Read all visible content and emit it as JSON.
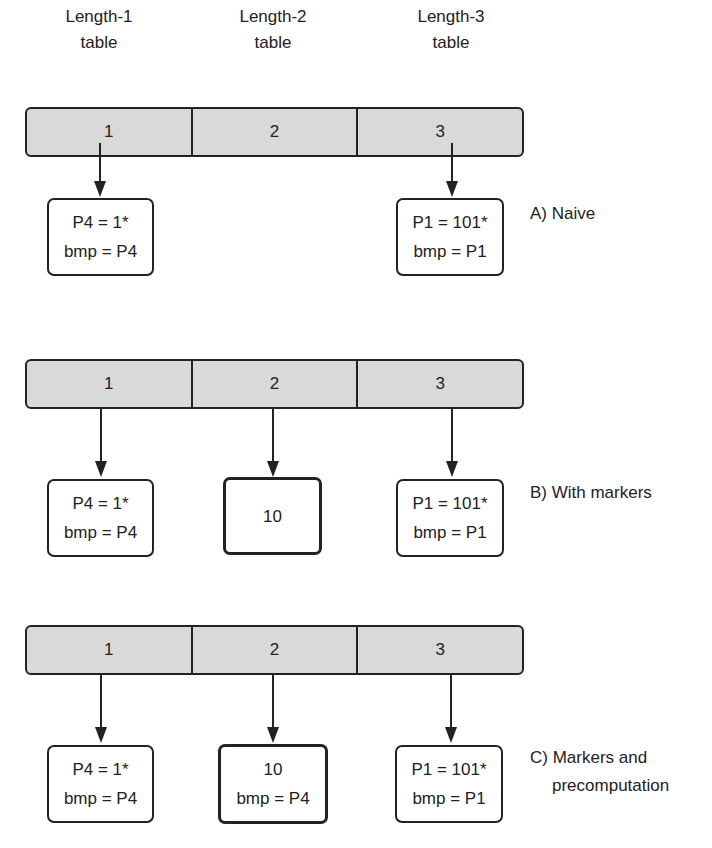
{
  "diagram": {
    "headers": [
      {
        "line1": "Length-1",
        "line2": "table"
      },
      {
        "line1": "Length-2",
        "line2": "table"
      },
      {
        "line1": "Length-3",
        "line2": "table"
      }
    ],
    "sections": [
      {
        "id": "A",
        "label": "A) Naive",
        "bar_cells": [
          "1",
          "2",
          "3"
        ],
        "entries": [
          {
            "column": 1,
            "type": "prefix",
            "line1": "P4 = 1*",
            "line2": "bmp = P4"
          },
          {
            "column": 3,
            "type": "prefix",
            "line1": "P1 = 101*",
            "line2": "bmp = P1"
          }
        ]
      },
      {
        "id": "B",
        "label": "B) With markers",
        "bar_cells": [
          "1",
          "2",
          "3"
        ],
        "entries": [
          {
            "column": 1,
            "type": "prefix",
            "line1": "P4 = 1*",
            "line2": "bmp = P4"
          },
          {
            "column": 2,
            "type": "marker",
            "line1": "10",
            "line2": ""
          },
          {
            "column": 3,
            "type": "prefix",
            "line1": "P1 = 101*",
            "line2": "bmp = P1"
          }
        ]
      },
      {
        "id": "C",
        "label_line1": "C) Markers and",
        "label_line2": "precomputation",
        "bar_cells": [
          "1",
          "2",
          "3"
        ],
        "entries": [
          {
            "column": 1,
            "type": "prefix",
            "line1": "P4 = 1*",
            "line2": "bmp = P4"
          },
          {
            "column": 2,
            "type": "marker",
            "line1": "10",
            "line2": "bmp = P4"
          },
          {
            "column": 3,
            "type": "prefix",
            "line1": "P1 = 101*",
            "line2": "bmp = P1"
          }
        ]
      }
    ],
    "colors": {
      "bar_fill": "#d9d9d9",
      "stroke": "#222222",
      "background": "#ffffff"
    }
  }
}
